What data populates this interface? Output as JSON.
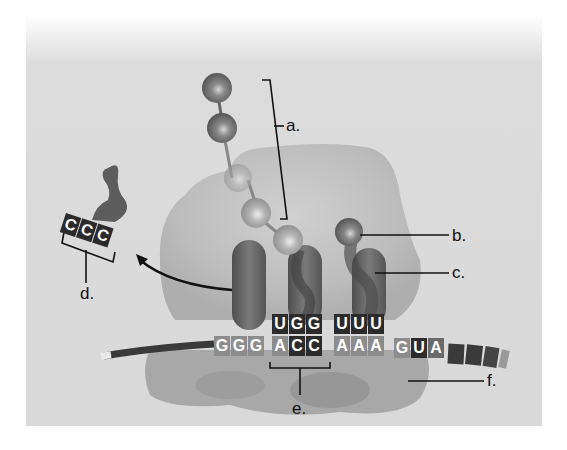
{
  "diagram": {
    "labels": {
      "a": "a.",
      "b": "b.",
      "c": "c.",
      "d": "d.",
      "e": "e.",
      "f": "f."
    },
    "mrna": {
      "codons": [
        {
          "seq": "GGG",
          "letters": [
            "G",
            "G",
            "G"
          ]
        },
        {
          "seq": "ACC",
          "letters": [
            "A",
            "C",
            "C"
          ]
        },
        {
          "seq": "AAA",
          "letters": [
            "A",
            "A",
            "A"
          ]
        },
        {
          "seq": "GUA",
          "letters": [
            "G",
            "U",
            "A"
          ]
        }
      ]
    },
    "trna_anticodons": [
      {
        "seq": "UGG",
        "letters": [
          "U",
          "G",
          "G"
        ]
      },
      {
        "seq": "UUU",
        "letters": [
          "U",
          "U",
          "U"
        ]
      }
    ],
    "released_trna": {
      "anticodon": "CCC",
      "letters": [
        "C",
        "C",
        "C"
      ]
    },
    "colors": {
      "background_panel": "#d9d9d9",
      "ribosome": "#bdbdbd",
      "trna": "#6e6e6e",
      "amino_acid_dark": "#7a7a7a",
      "amino_acid_light": "#b0b0b0",
      "nucleotide_dark": "#2b2b2b",
      "nucleotide_light": "#8c8c8c",
      "label_line": "#111111"
    }
  }
}
